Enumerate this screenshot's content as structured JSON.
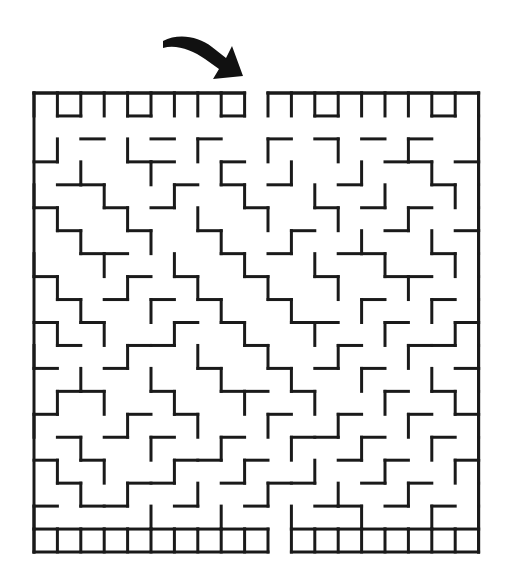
{
  "page": {
    "background_color": "#ffffff",
    "width": 510,
    "height": 587
  },
  "arrow": {
    "name": "entrance-arrow",
    "color": "#111111",
    "description": "curved arrow pointing down-right at maze entrance",
    "tail_x": 163,
    "tail_y": 40,
    "tip_x": 233,
    "tip_y": 74
  },
  "maze": {
    "name": "maze-grid",
    "wall_color": "#1a1a1a",
    "wall_thickness": 3,
    "origin_x": 34,
    "origin_y": 93,
    "cell_width": 23.4,
    "cell_height": 22.95,
    "cols": 19,
    "rows": 20,
    "entrance": {
      "label": "entrance",
      "side": "top",
      "col": 9
    },
    "exit": {
      "label": "exit",
      "side": "bottom",
      "col": 10
    },
    "h_walls": [
      "1111111110111111111",
      "0100100010001000010",
      "0010010100101010100",
      "1000110010000001101",
      "0110001010100100010",
      "1001010001001010100",
      "0100100100010001001",
      "0011000010100110010",
      "1000101001001001100",
      "0101010100100010010",
      "1010001010011001001",
      "0100110001000100110",
      "1001000100101010001",
      "0110010011010001010",
      "1000101000100100101",
      "0101010010011010010",
      "1010001101000101001",
      "0100110010110010100",
      "1011001001001101010",
      "1111111111011111111"
    ],
    "v_walls": [
      "10001001000100100011",
      "10100100101001001001",
      "10010010010010010101",
      "10001001001001001001",
      "10100100100100100101",
      "10010010010010010011",
      "10001001001001001001",
      "10100100100100100101",
      "10010010010010010011",
      "10001001001001001001",
      "10100100100100100101",
      "10010010010010010011",
      "10001001001001001001",
      "10100100100100100101",
      "10010010010010010011",
      "10001001001001001001",
      "10100100100100100101",
      "10010010010010010011",
      "10001001001001001001",
      "11111111111111111111"
    ]
  }
}
